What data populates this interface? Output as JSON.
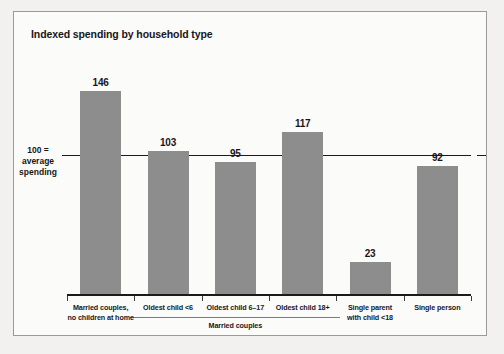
{
  "chart_data": {
    "type": "bar",
    "title": "Indexed spending by household type",
    "xlabel": "",
    "ylabel": "",
    "ylim": [
      0,
      160
    ],
    "grid": false,
    "legend": null,
    "reference_line": {
      "value": 100,
      "label_lines": [
        "100 =",
        "average",
        "spending"
      ]
    },
    "categories": [
      "Married couples,\nno children at home",
      "Oldest child <6",
      "Oldest child 6–17",
      "Oldest child 18+",
      "Single parent\nwith child <18",
      "Single person"
    ],
    "values": [
      146,
      103,
      95,
      117,
      23,
      92
    ],
    "group_brackets": [
      {
        "label": "Married couples",
        "from_index": 1,
        "to_index": 3
      }
    ],
    "colors": {
      "bar": "#8d8d8d",
      "axis": "#1b1b1b",
      "text": "#17171a",
      "background": "#fbfbfa",
      "page": "#f2f1ef",
      "frame": "#9a9a96"
    }
  },
  "bars": [
    {
      "value_label": "146",
      "cat_line1": "Married couples,",
      "cat_line2": "no children at home"
    },
    {
      "value_label": "103",
      "cat_line1": "Oldest child <6",
      "cat_line2": ""
    },
    {
      "value_label": "95",
      "cat_line1": "Oldest child 6–17",
      "cat_line2": ""
    },
    {
      "value_label": "117",
      "cat_line1": "Oldest child 18+",
      "cat_line2": ""
    },
    {
      "value_label": "23",
      "cat_line1": "Single parent",
      "cat_line2": "with child <18"
    },
    {
      "value_label": "92",
      "cat_line1": "Single person",
      "cat_line2": ""
    }
  ],
  "axis": {
    "ref_line1": "100 =",
    "ref_line2": "average",
    "ref_line3": "spending"
  },
  "group": {
    "married_couples_label": "Married couples"
  }
}
